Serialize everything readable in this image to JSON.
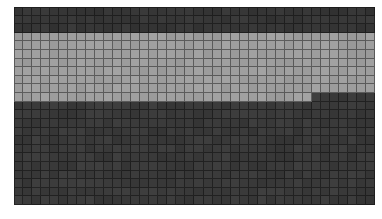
{
  "window": {
    "background_color": "#ffffff"
  },
  "chart_data": {
    "type": "heatmap",
    "title": "",
    "xlabel": "",
    "ylabel": "",
    "axes": "none",
    "legend": "none",
    "grid": "on",
    "columns": 40,
    "rows": 23,
    "cell_order": "row-major",
    "runs": [
      {
        "value": "dark_top",
        "count": 120
      },
      {
        "value": "light",
        "count": 313
      },
      {
        "value": "dark_bottom",
        "count": 487
      }
    ],
    "bands_description": [
      {
        "name": "top-dark-band",
        "rows": "1-3",
        "value": "dark_top"
      },
      {
        "name": "middle-light-band",
        "rows": "4-11 (row 11 light only through column 33)",
        "value": "light"
      },
      {
        "name": "bottom-dark-band",
        "rows": "11 (columns 34-40) through 23",
        "value": "dark_bottom"
      }
    ],
    "value_colors": {
      "dark_top": "#363636",
      "light": "#9e9e9e",
      "dark_bottom": "#3a3a3a"
    },
    "grid_line_color": "rgba(0,0,0,0.42)",
    "noise_amplitude": 5
  }
}
